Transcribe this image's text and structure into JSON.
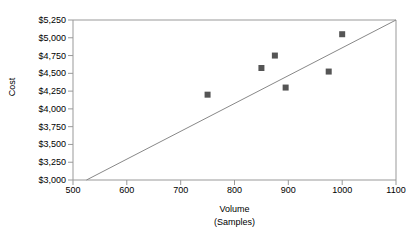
{
  "chart_data": {
    "type": "scatter",
    "title": "",
    "xlabel": "Volume (Samples)",
    "xlabel_line1": "Volume",
    "xlabel_line2": "(Samples)",
    "ylabel": "Cost",
    "xlim": [
      500,
      1100
    ],
    "ylim": [
      3000,
      5250
    ],
    "xticks": [
      500,
      600,
      700,
      800,
      900,
      1000,
      1100
    ],
    "xtick_labels": [
      "500",
      "600",
      "700",
      "800",
      "900",
      "1000",
      "1100"
    ],
    "yticks": [
      3000,
      3250,
      3500,
      3750,
      4000,
      4250,
      4500,
      4750,
      5000,
      5250
    ],
    "ytick_labels": [
      "$3,000",
      "$3,250",
      "$3,500",
      "$3,750",
      "$4,000",
      "$4,250",
      "$4,500",
      "$4,750",
      "$5,000",
      "$5,250"
    ],
    "grid": false,
    "legend": null,
    "series": [
      {
        "name": "Cost vs Volume",
        "marker": "square",
        "marker_color": "#555555",
        "points": [
          {
            "x": 750,
            "y": 4200
          },
          {
            "x": 850,
            "y": 4575
          },
          {
            "x": 875,
            "y": 4750
          },
          {
            "x": 895,
            "y": 4300
          },
          {
            "x": 975,
            "y": 4525
          },
          {
            "x": 1000,
            "y": 5050
          }
        ]
      }
    ],
    "trend_line": {
      "name": "fixed-plus-variable cost line",
      "color": "#888888",
      "x_start": 525,
      "y_start": 3000,
      "x_end": 1100,
      "y_end": 5250
    },
    "axis_color": "#999999",
    "plot_background": "#ffffff"
  }
}
